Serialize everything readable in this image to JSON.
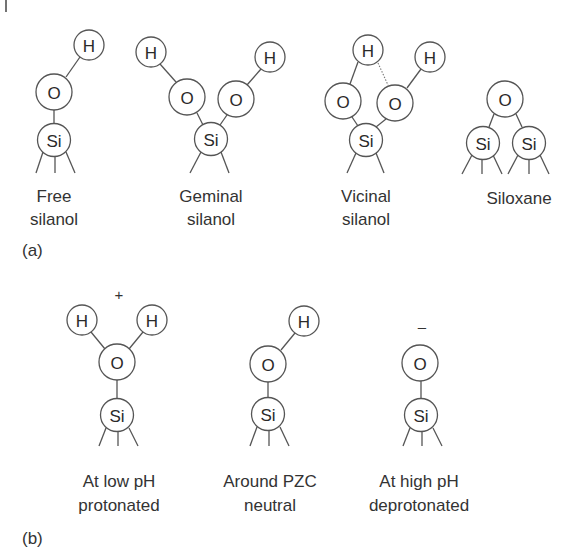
{
  "figure": {
    "panel_a": {
      "label": "(a)",
      "structures": [
        {
          "name": "free-silanol",
          "line1": "Free",
          "line2": "silanol"
        },
        {
          "name": "geminal-silanol",
          "line1": "Geminal",
          "line2": "silanol"
        },
        {
          "name": "vicinal-silanol",
          "line1": "Vicinal",
          "line2": "silanol"
        },
        {
          "name": "siloxane",
          "line1": "Siloxane",
          "line2": ""
        }
      ]
    },
    "panel_b": {
      "label": "(b)",
      "structures": [
        {
          "name": "protonated",
          "line1": "At low pH",
          "line2": "protonated",
          "charge": "+"
        },
        {
          "name": "neutral",
          "line1": "Around PZC",
          "line2": "neutral",
          "charge": ""
        },
        {
          "name": "deprotonated",
          "line1": "At high pH",
          "line2": "deprotonated",
          "charge": "–"
        }
      ]
    },
    "atoms": {
      "H": "H",
      "O": "O",
      "Si": "Si"
    }
  }
}
